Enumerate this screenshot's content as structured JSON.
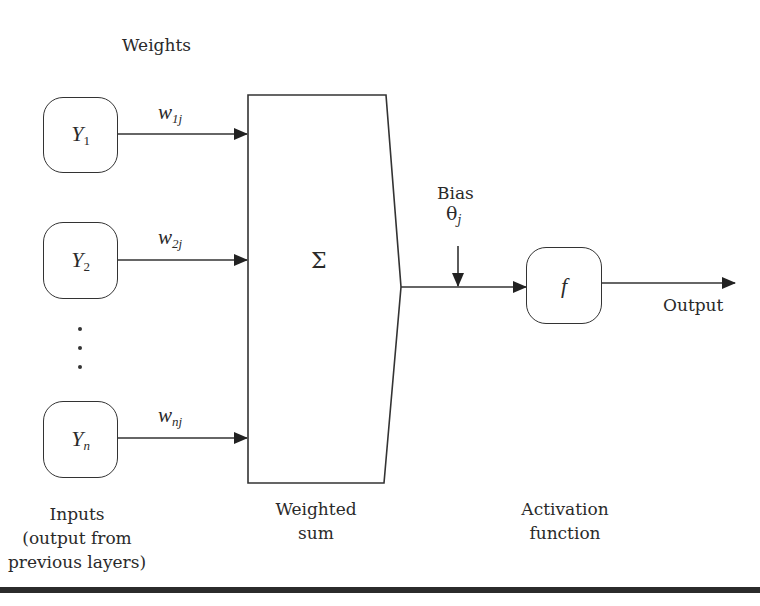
{
  "diagram": {
    "labels": {
      "weights": "Weights",
      "bias": "Bias",
      "output": "Output",
      "inputs_line1": "Inputs",
      "inputs_line2": "(output from",
      "inputs_line3": "previous layers)",
      "weighted_line1": "Weighted",
      "weighted_line2": "sum",
      "activation_line1": "Activation",
      "activation_line2": "function"
    },
    "inputs": [
      {
        "symbol": "Y",
        "sub": "1",
        "weight": "w",
        "weight_sub": "1j"
      },
      {
        "symbol": "Y",
        "sub": "2",
        "weight": "w",
        "weight_sub": "2j"
      },
      {
        "symbol": "Y",
        "sub": "n",
        "weight": "w",
        "weight_sub": "nj"
      }
    ],
    "ellipsis": "⋮",
    "sum_symbol": "Σ",
    "bias_symbol": "θ",
    "bias_sub": "j",
    "activation_symbol": "f",
    "colors": {
      "stroke": "#333333",
      "text": "#2a2a2a",
      "background": "#ffffff"
    }
  }
}
